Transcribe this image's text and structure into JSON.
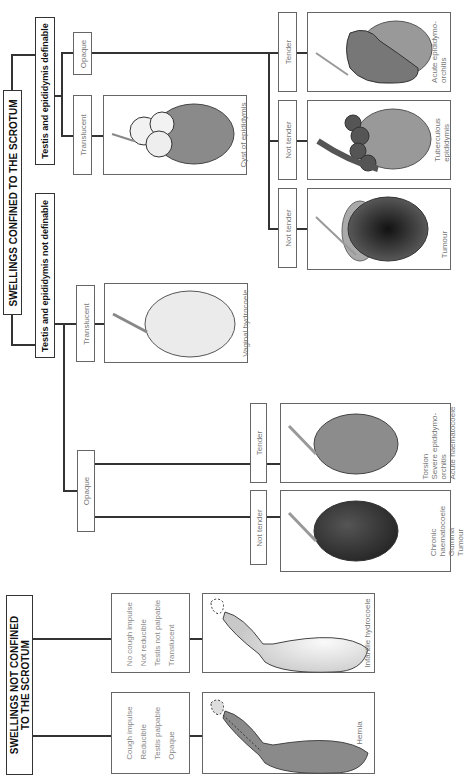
{
  "not_confined": {
    "title_line1": "SWELLINGS NOT CONFINED",
    "title_line2": "TO THE SCROTUM",
    "branches": [
      {
        "criteria": [
          "Cough impulse",
          "Reducible",
          "Testis palpable",
          "Opaque"
        ],
        "diagnosis": "Hernia"
      },
      {
        "criteria": [
          "No cough impulse",
          "Not reducible",
          "Testis not palpable",
          "Translucent"
        ],
        "diagnosis": "Infantile hydrocoele"
      }
    ]
  },
  "confined": {
    "title": "SWELLINGS CONFINED TO THE SCROTUM",
    "not_definable": {
      "title": "Testis and epididymis not definable",
      "opaque": {
        "label": "Opaque",
        "not_tender": {
          "label": "Not tender",
          "diagnosis": [
            "Chronic",
            "haematocoele",
            "Gumma",
            "Tumour"
          ]
        },
        "tender": {
          "label": "Tender",
          "diagnosis": [
            "Torsion",
            "Severe epididymo-",
            "orchitis",
            "Acute haematocoele"
          ]
        }
      },
      "translucent": {
        "label": "Translucent",
        "diagnosis": "Vaginal hydrocoele"
      }
    },
    "definable": {
      "title": "Testis and epididymis definable",
      "translucent": {
        "label": "Translucent",
        "diagnosis": "Cyst of epididymis"
      },
      "opaque": {
        "label": "Opaque",
        "not_tender_1": {
          "label": "Not tender",
          "diagnosis": "Tumour"
        },
        "not_tender_2": {
          "label": "Not tender",
          "diagnosis": [
            "Tuberculous",
            "epididymis"
          ]
        },
        "tender": {
          "label": "Tender",
          "diagnosis": [
            "Acute epididymo-",
            "orchitis"
          ]
        }
      }
    }
  },
  "colors": {
    "line": "#333333",
    "box_border": "#666666",
    "opaque_fill": "#8a8a8a",
    "translucent_fill": "#e4e4e4"
  }
}
